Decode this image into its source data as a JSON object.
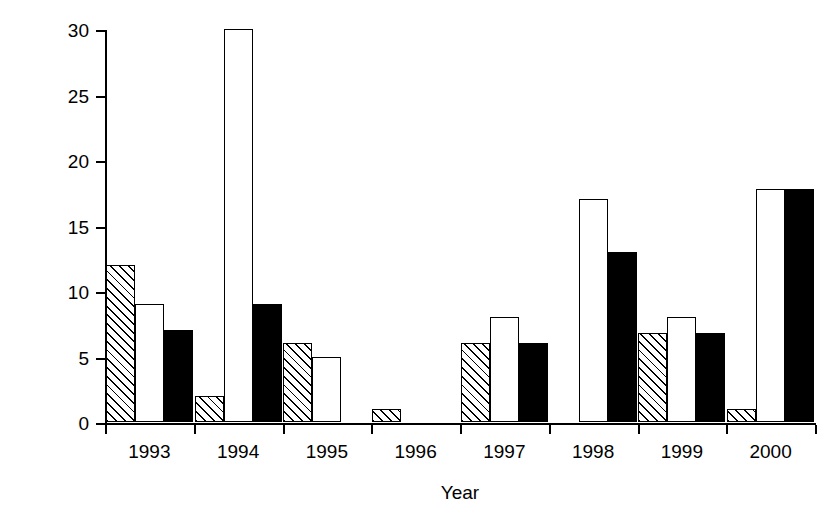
{
  "chart_data": {
    "type": "bar",
    "title": "",
    "xlabel": "Year",
    "ylabel": "Number of animals",
    "categories": [
      "1993",
      "1994",
      "1995",
      "1996",
      "1997",
      "1998",
      "1999",
      "2000"
    ],
    "series": [
      {
        "name": "hatched",
        "fill": "hatched",
        "values": [
          12,
          2,
          6,
          1,
          6,
          null,
          6.8,
          1
        ]
      },
      {
        "name": "white",
        "fill": "white",
        "values": [
          9,
          30,
          5,
          null,
          8,
          17,
          8,
          17.8
        ]
      },
      {
        "name": "black",
        "fill": "black",
        "values": [
          7,
          9,
          null,
          null,
          6,
          13,
          6.8,
          17.8
        ]
      }
    ],
    "ylim": [
      0,
      30
    ],
    "yticks": [
      0,
      5,
      10,
      15,
      20,
      25,
      30
    ],
    "ytick_labels": [
      "0",
      "5",
      "10",
      "15",
      "20",
      "25",
      "30"
    ],
    "xlim": [
      0,
      8
    ],
    "grid": false,
    "legend": "none",
    "colors": {
      "axis": "#000000",
      "bar_outline": "#000000",
      "bar_white": "#ffffff",
      "bar_black": "#000000",
      "background": "#ffffff"
    }
  }
}
